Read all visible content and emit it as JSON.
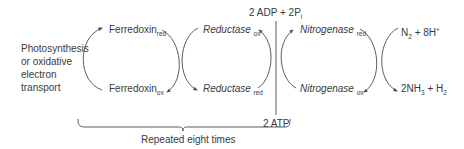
{
  "diagram": {
    "source": {
      "lines": [
        "Photosynthesis",
        "or oxidative",
        "electron",
        "transport"
      ]
    },
    "ferredoxin": {
      "red": {
        "base": "Ferredoxin",
        "sub": "red"
      },
      "ox": {
        "base": "Ferredoxin",
        "sub": "ox"
      }
    },
    "reductase": {
      "ox": {
        "base": "Reductase",
        "sub": "ox"
      },
      "red": {
        "base": "Reductase",
        "sub": "red"
      }
    },
    "nitrogenase": {
      "red": {
        "base": "Nitrogenase",
        "sub": "red"
      },
      "ox": {
        "base": "Nitrogenase",
        "sub": "ox"
      }
    },
    "atp": {
      "products": {
        "a": "2 ADP + 2P",
        "sub": "i"
      },
      "input": "2 ATP"
    },
    "substrate": {
      "n": "N",
      "n_sub": "2",
      "rest": " + 8H",
      "sup": "+"
    },
    "product": {
      "a": "2NH",
      "a_sub": "3",
      "b": " + H",
      "b_sub": "2"
    },
    "brace_label": "Repeated eight times",
    "colors": {
      "line": "#4a4a4a",
      "text": "#3a3a3a"
    }
  }
}
